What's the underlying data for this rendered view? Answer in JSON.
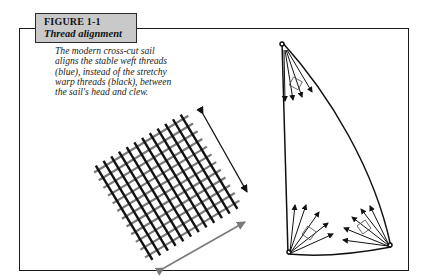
{
  "figure": {
    "number": "FIGURE 1-1",
    "title": "Thread alignment",
    "caption_lines": [
      "The modern cross-cut sail",
      "aligns the stable weft threads",
      "(blue), instead of the stretchy",
      "warp threads (black), between",
      "the sail's head and clew."
    ]
  },
  "colors": {
    "header_fill": "#c9c9c9",
    "warp_thread": "#111111",
    "weft_thread": "#7a7a7a",
    "frame": "#1a1a1a"
  },
  "illustrations": {
    "thread_grid": {
      "warp_arrow": "black double-headed arrow",
      "weft_arrow": "gray double-headed arrow"
    },
    "sail": {
      "corners": [
        "head",
        "tack",
        "clew"
      ],
      "stress_fans": 3
    }
  }
}
